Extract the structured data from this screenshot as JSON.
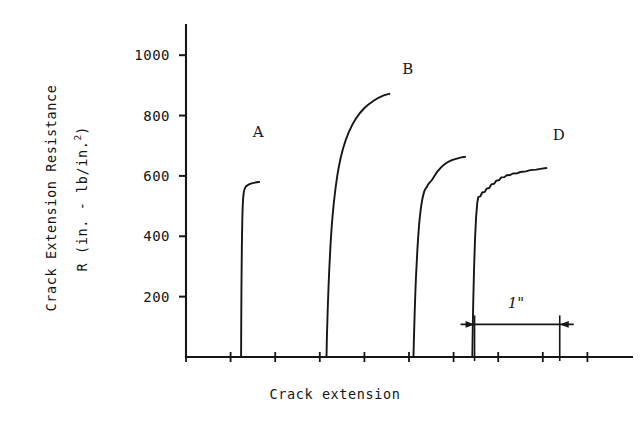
{
  "figure": {
    "background_color": "#ffffff",
    "ink_color": "#161616"
  },
  "chart_data": {
    "type": "line",
    "title": "",
    "xlabel": "Crack extension",
    "ylabel_line1": "Crack Extension Resistance",
    "ylabel_line2_prefix": "R  (in. - lb/in.",
    "ylabel_line2_sup": "2",
    "ylabel_line2_suffix": ")",
    "ylabel_full": "R  (in. - lb/in.2)",
    "ylim": [
      0,
      1100
    ],
    "yticks": [
      200,
      400,
      600,
      800,
      1000
    ],
    "ytick_labels": [
      "200",
      "400",
      "600",
      "800",
      "1000"
    ],
    "xlim": [
      0,
      10
    ],
    "xticks": [
      0,
      1,
      2,
      3,
      4,
      5,
      6,
      7,
      8,
      9
    ],
    "xtick_labels": [
      "",
      "",
      "",
      "",
      "",
      "",
      "",
      "",
      "",
      ""
    ],
    "grid": false,
    "legend_position": "inline-annotations",
    "annotations": [
      {
        "text": "A",
        "x": 1.62,
        "y": 745
      },
      {
        "text": "B",
        "x": 4.97,
        "y": 955
      },
      {
        "text": "D",
        "x": 8.36,
        "y": 735
      }
    ],
    "scalebar": {
      "label": "1\"",
      "x_start": 6.47,
      "x_end": 8.38,
      "y": 108,
      "caption_x": 7.4,
      "caption_y": 180
    },
    "series": [
      {
        "name": "A",
        "label": "A",
        "plateau": 570,
        "points": [
          [
            1.235,
            0
          ],
          [
            1.237,
            60
          ],
          [
            1.24,
            150
          ],
          [
            1.245,
            260
          ],
          [
            1.252,
            360
          ],
          [
            1.262,
            450
          ],
          [
            1.275,
            510
          ],
          [
            1.295,
            545
          ],
          [
            1.33,
            562
          ],
          [
            1.39,
            570
          ],
          [
            1.47,
            575
          ],
          [
            1.56,
            578
          ],
          [
            1.64,
            580
          ]
        ]
      },
      {
        "name": "B",
        "label": "B",
        "plateau": 870,
        "points": [
          [
            3.15,
            0
          ],
          [
            3.16,
            70
          ],
          [
            3.178,
            160
          ],
          [
            3.205,
            265
          ],
          [
            3.24,
            370
          ],
          [
            3.285,
            465
          ],
          [
            3.345,
            550
          ],
          [
            3.42,
            625
          ],
          [
            3.52,
            690
          ],
          [
            3.65,
            745
          ],
          [
            3.81,
            790
          ],
          [
            4.0,
            825
          ],
          [
            4.215,
            850
          ],
          [
            4.42,
            866
          ],
          [
            4.56,
            872
          ]
        ]
      },
      {
        "name": "C",
        "label": "",
        "plateau": 660,
        "points": [
          [
            5.1,
            0
          ],
          [
            5.112,
            70
          ],
          [
            5.13,
            160
          ],
          [
            5.155,
            260
          ],
          [
            5.188,
            355
          ],
          [
            5.228,
            440
          ],
          [
            5.278,
            505
          ],
          [
            5.34,
            548
          ],
          [
            5.405,
            565
          ],
          [
            5.43,
            572
          ],
          [
            5.52,
            588
          ],
          [
            5.64,
            615
          ],
          [
            5.79,
            638
          ],
          [
            5.96,
            652
          ],
          [
            6.13,
            660
          ],
          [
            6.26,
            663
          ]
        ]
      },
      {
        "name": "D",
        "label": "D",
        "plateau": 625,
        "stepped": true,
        "points": [
          [
            6.42,
            0
          ],
          [
            6.428,
            80
          ],
          [
            6.44,
            180
          ],
          [
            6.458,
            290
          ],
          [
            6.48,
            390
          ],
          [
            6.505,
            465
          ],
          [
            6.53,
            510
          ],
          [
            6.552,
            530
          ],
          [
            6.6,
            532
          ],
          [
            6.64,
            545
          ],
          [
            6.7,
            547
          ],
          [
            6.74,
            558
          ],
          [
            6.8,
            560
          ],
          [
            6.845,
            572
          ],
          [
            6.91,
            574
          ],
          [
            6.955,
            584
          ],
          [
            7.02,
            586
          ],
          [
            7.07,
            595
          ],
          [
            7.14,
            596
          ],
          [
            7.19,
            602
          ],
          [
            7.27,
            603
          ],
          [
            7.33,
            608
          ],
          [
            7.43,
            609
          ],
          [
            7.5,
            613
          ],
          [
            7.62,
            615
          ],
          [
            7.72,
            619
          ],
          [
            7.85,
            621
          ],
          [
            7.98,
            624
          ],
          [
            8.08,
            626
          ]
        ]
      }
    ]
  }
}
